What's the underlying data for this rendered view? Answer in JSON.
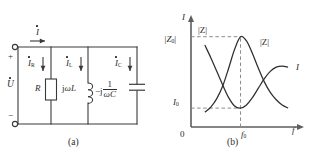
{
  "figure": {
    "panels": [
      {
        "id": "a",
        "caption": "(a)",
        "type": "circuit-diagram",
        "terminals": {
          "positive_sign": "+",
          "negative_sign": "−"
        },
        "source_label": "U",
        "source_has_phasor_dot": true,
        "currents": [
          {
            "name": "total-current",
            "symbol": "I",
            "subscript": "",
            "dot": true
          },
          {
            "name": "resistor-current",
            "symbol": "I",
            "subscript": "R",
            "dot": true
          },
          {
            "name": "inductor-current",
            "symbol": "I",
            "subscript": "L",
            "dot": true
          },
          {
            "name": "capacitor-current",
            "symbol": "I",
            "subscript": "C",
            "dot": true
          }
        ],
        "components": [
          {
            "name": "resistor",
            "label": "R",
            "kind": "resistor"
          },
          {
            "name": "inductor",
            "label_prefix": "j",
            "label_omega": "ω",
            "label_suffix": "L",
            "kind": "inductor"
          },
          {
            "name": "capacitor",
            "label_prefix": "−j",
            "numerator": "1",
            "denominator": "ωC",
            "kind": "capacitor"
          }
        ]
      },
      {
        "id": "b",
        "caption": "(b)",
        "type": "resonance-response-plot"
      }
    ]
  },
  "chart_data": {
    "type": "line",
    "title": "",
    "subtitle": "",
    "xlabel": "f",
    "ylabel": "I",
    "grid": false,
    "legend": "inline-curve-labels",
    "axis_origin_label": "0",
    "xticks": [
      {
        "label": "f",
        "subscript": "0",
        "value": 1.0
      }
    ],
    "yticks": [
      {
        "label": "I",
        "subscript": "0",
        "value": 0.18
      },
      {
        "label": "|Z",
        "subscript": "0",
        "suffix": "|",
        "value": 0.86
      }
    ],
    "xlim": [
      0,
      2.2
    ],
    "ylim": [
      0,
      1.0
    ],
    "annotations": [
      {
        "name": "impedance-axis-note",
        "text": "|Z|"
      },
      {
        "name": "impedance-curve-label",
        "text": "|Z|"
      },
      {
        "name": "current-curve-label",
        "text": "I"
      }
    ],
    "dashed_guides": [
      {
        "name": "peak-horizontal-guide",
        "from": [
          0,
          0.86
        ],
        "to": [
          1.0,
          0.86
        ]
      },
      {
        "name": "peak-vertical-guide",
        "from": [
          1.0,
          0.0
        ],
        "to": [
          1.0,
          0.86
        ]
      },
      {
        "name": "minimum-horizontal-guide",
        "from": [
          0,
          0.18
        ],
        "to": [
          1.0,
          0.18
        ]
      }
    ],
    "series": [
      {
        "name": "|Z|",
        "description": "impedance magnitude, resonant peak at f0 reaching |Z0|",
        "x": [
          0.28,
          0.4,
          0.52,
          0.64,
          0.76,
          0.88,
          1.0,
          1.12,
          1.24,
          1.36,
          1.48,
          1.6,
          1.72,
          1.84,
          1.96
        ],
        "values": [
          0.14,
          0.19,
          0.27,
          0.39,
          0.56,
          0.74,
          0.86,
          0.82,
          0.7,
          0.56,
          0.43,
          0.33,
          0.26,
          0.21,
          0.18
        ]
      },
      {
        "name": "I",
        "description": "current magnitude, minimum I0 at f0 then rising",
        "x": [
          0.28,
          0.4,
          0.52,
          0.64,
          0.76,
          0.88,
          1.0,
          1.12,
          1.24,
          1.36,
          1.48,
          1.6,
          1.72,
          1.84,
          1.96
        ],
        "values": [
          0.78,
          0.66,
          0.53,
          0.4,
          0.28,
          0.2,
          0.18,
          0.21,
          0.28,
          0.37,
          0.46,
          0.53,
          0.57,
          0.58,
          0.57
        ]
      }
    ]
  }
}
